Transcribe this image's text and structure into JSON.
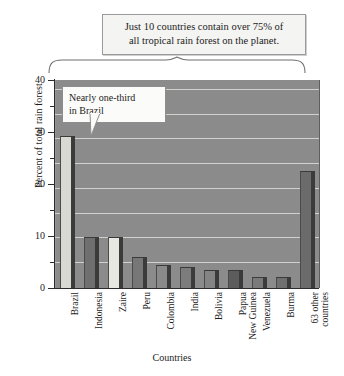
{
  "title_box": {
    "line1": "Just 10 countries contain over 75% of",
    "line2": "all tropical rain forest on the planet."
  },
  "annotation": {
    "line1": "Nearly one-third",
    "line2": "in Brazil"
  },
  "axes": {
    "y_title": "Percent of total rain forest",
    "x_title": "Countries",
    "y_ticks": [
      "0",
      "10",
      "20",
      "30",
      "40"
    ]
  },
  "colors": {
    "plot_background": "#8e8e8e",
    "gridline": "#dcdcd8",
    "axis": "#2b2b2b",
    "bar_light": "#d9d9d4",
    "bar_medium": "#9e9e9e",
    "bar_dark": "#6f6f6f",
    "bar_side_shadow": "#3b3b3b",
    "callout_background": "#f4f4f2",
    "callout_border": "#9a9a9a"
  },
  "chart_data": {
    "type": "bar",
    "title": "Just 10 countries contain over 75% of all tropical rain forest on the planet.",
    "xlabel": "Countries",
    "ylabel": "Percent of total rain forest",
    "ylim": [
      0,
      42
    ],
    "grid": true,
    "legend": "none",
    "categories": [
      "Brazil",
      "Indonesia",
      "Zaire",
      "Peru",
      "Colombia",
      "India",
      "Bolivia",
      "Papua New Guinea",
      "Venezuela",
      "Burma",
      "63 other countries"
    ],
    "category_lines": [
      [
        "Brazil",
        ""
      ],
      [
        "Indonesia",
        ""
      ],
      [
        "Zaire",
        ""
      ],
      [
        "Peru",
        ""
      ],
      [
        "Colombia",
        ""
      ],
      [
        "India",
        ""
      ],
      [
        "Bolivia",
        ""
      ],
      [
        "Papua",
        "New Guinea"
      ],
      [
        "Venezuela",
        ""
      ],
      [
        "Burma",
        ""
      ],
      [
        "63 other",
        "countries"
      ]
    ],
    "values": [
      30.5,
      10,
      10,
      6,
      4.5,
      4,
      3.5,
      3.5,
      2,
      2,
      23.5
    ],
    "bar_shades": [
      "#d9d9d4",
      "#6f6f6f",
      "#e8e8e3",
      "#777777",
      "#8a8a8a",
      "#7c7c7c",
      "#848484",
      "#5c5c5c",
      "#7a7a7a",
      "#707070",
      "#6b6b6b"
    ],
    "annotations": [
      {
        "text": "Nearly one-third in Brazil",
        "target": "Brazil"
      },
      {
        "text": "Just 10 countries contain over 75% of all tropical rain forest on the planet.",
        "target": "brace-top"
      }
    ]
  }
}
